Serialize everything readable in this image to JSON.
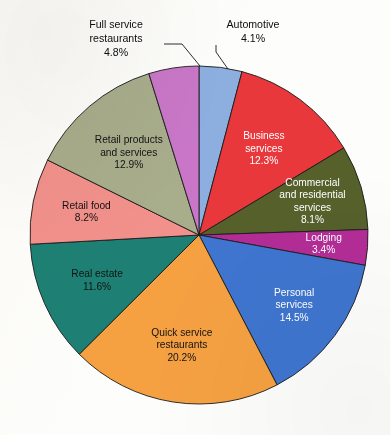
{
  "chart_data": {
    "type": "pie",
    "title": "",
    "subtitle": "",
    "xlabel": "",
    "ylabel": "",
    "legend_position": "none",
    "grid": false,
    "units": "percent",
    "total": 100.1,
    "start_angle_deg": 0,
    "direction": "clockwise",
    "categories": [
      "Automotive",
      "Business services",
      "Commercial and residential services",
      "Lodging",
      "Personal services",
      "Quick service restaurants",
      "Real estate",
      "Retail food",
      "Retail products and services",
      "Full service restaurants"
    ],
    "values": [
      4.1,
      12.3,
      8.1,
      3.4,
      14.5,
      20.2,
      11.6,
      8.2,
      12.9,
      4.8
    ],
    "colors": [
      "#8cafe0",
      "#e8383c",
      "#55602b",
      "#b32c96",
      "#3f75d0",
      "#f5a142",
      "#1e8074",
      "#f2918c",
      "#a8ad8c",
      "#c976c8"
    ],
    "slices": [
      {
        "name": "Automotive",
        "label_lines": [
          "Automotive"
        ],
        "percent_text": "4.1%",
        "value": 4.1,
        "color": "#8cafe0",
        "label_placement": "outside",
        "text_color": "dark"
      },
      {
        "name": "Business services",
        "label_lines": [
          "Business",
          "services"
        ],
        "percent_text": "12.3%",
        "value": 12.3,
        "color": "#e8383c",
        "label_placement": "inside",
        "text_color": "light"
      },
      {
        "name": "Commercial and residential services",
        "label_lines": [
          "Commercial",
          "and residential",
          "services"
        ],
        "percent_text": "8.1%",
        "value": 8.1,
        "color": "#55602b",
        "label_placement": "inside",
        "text_color": "light"
      },
      {
        "name": "Lodging",
        "label_lines": [
          "Lodging"
        ],
        "percent_text": "3.4%",
        "value": 3.4,
        "color": "#b32c96",
        "label_placement": "inside",
        "text_color": "light"
      },
      {
        "name": "Personal services",
        "label_lines": [
          "Personal",
          "services"
        ],
        "percent_text": "14.5%",
        "value": 14.5,
        "color": "#3f75d0",
        "label_placement": "inside",
        "text_color": "light"
      },
      {
        "name": "Quick service restaurants",
        "label_lines": [
          "Quick service",
          "restaurants"
        ],
        "percent_text": "20.2%",
        "value": 20.2,
        "color": "#f5a142",
        "label_placement": "inside",
        "text_color": "dark"
      },
      {
        "name": "Real estate",
        "label_lines": [
          "Real estate"
        ],
        "percent_text": "11.6%",
        "value": 11.6,
        "color": "#1e8074",
        "label_placement": "inside",
        "text_color": "dark"
      },
      {
        "name": "Retail food",
        "label_lines": [
          "Retail food"
        ],
        "percent_text": "8.2%",
        "value": 8.2,
        "color": "#f2918c",
        "label_placement": "inside",
        "text_color": "dark"
      },
      {
        "name": "Retail products and services",
        "label_lines": [
          "Retail products",
          "and services"
        ],
        "percent_text": "12.9%",
        "value": 12.9,
        "color": "#a8ad8c",
        "label_placement": "inside",
        "text_color": "dark"
      },
      {
        "name": "Full service restaurants",
        "label_lines": [
          "Full service",
          "restaurants"
        ],
        "percent_text": "4.8%",
        "value": 4.8,
        "color": "#c976c8",
        "label_placement": "outside",
        "text_color": "dark"
      }
    ]
  },
  "geometry": {
    "center_x": 199,
    "center_y": 235,
    "radius": 169,
    "label_radius_factor": 0.66
  },
  "outside_labels": [
    {
      "name": "full-service-restaurants",
      "lines": [
        "Full service",
        "restaurants",
        "4.8%"
      ],
      "text_x": 116,
      "text_y": 28,
      "line_height": 14,
      "leader": "M 164 44 L 182 44 L 200 66"
    },
    {
      "name": "automotive",
      "lines": [
        "Automotive",
        "4.1%"
      ],
      "text_x": 253,
      "text_y": 28,
      "line_height": 14,
      "leader": "M 216 45 L 216 52 L 228 69"
    }
  ]
}
